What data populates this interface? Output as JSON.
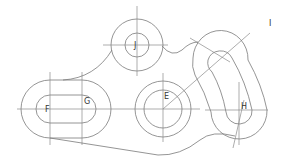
{
  "drawing": {
    "type": "2D mechanical part drawing",
    "stroke_color": "#7a7a7a",
    "background": "#ffffff",
    "labels": [
      {
        "id": "J",
        "text": "J",
        "x": 134,
        "y": 42
      },
      {
        "id": "I",
        "text": "I",
        "x": 269,
        "y": 20
      },
      {
        "id": "G",
        "text": "G",
        "x": 84,
        "y": 98
      },
      {
        "id": "F",
        "text": "F",
        "x": 45,
        "y": 106
      },
      {
        "id": "E",
        "text": "E",
        "x": 164,
        "y": 93
      },
      {
        "id": "H",
        "text": "H",
        "x": 241,
        "y": 103
      }
    ],
    "features": {
      "circle_J": {
        "cx": 137,
        "cy": 45,
        "r_outer": 26,
        "r_inner": 12
      },
      "circle_E": {
        "cx": 163,
        "cy": 109,
        "r_outer": 28,
        "r_inner": 19
      },
      "slot_FG": {
        "cx_left": 50,
        "cx_right": 82,
        "cy": 109,
        "r_outer": 29,
        "r_inner": 14
      },
      "curved_slot_H": {
        "lower_center": [
          239,
          110
        ],
        "upper_center": [
          220,
          58
        ],
        "r_outer": 28,
        "r_inner": 13
      }
    }
  }
}
